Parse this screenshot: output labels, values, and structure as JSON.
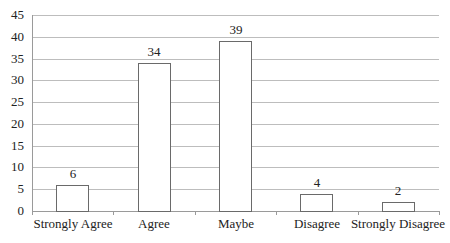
{
  "chart_data": {
    "type": "bar",
    "title": "",
    "xlabel": "",
    "ylabel": "",
    "categories": [
      "Strongly Agree",
      "Agree",
      "Maybe",
      "Disagree",
      "Strongly Disagree"
    ],
    "values": [
      6,
      34,
      39,
      4,
      2
    ],
    "data_labels": [
      "6",
      "34",
      "39",
      "4",
      "2"
    ],
    "ylim": [
      0,
      45
    ],
    "yticks": [
      0,
      5,
      10,
      15,
      20,
      25,
      30,
      35,
      40,
      45
    ],
    "ytick_labels": [
      "0",
      "5",
      "10",
      "15",
      "20",
      "25",
      "30",
      "35",
      "40",
      "45"
    ],
    "grid": true,
    "legend": null,
    "colors": {
      "bar_fill": "#ffffff",
      "bar_border": "#6a6a6a",
      "grid": "#bdbdbd"
    }
  }
}
